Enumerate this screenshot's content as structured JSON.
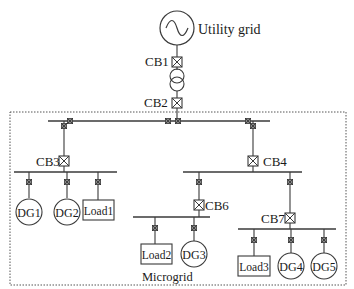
{
  "diagram": {
    "type": "single-line electrical diagram",
    "source": {
      "label": "Utility grid"
    },
    "breakers": {
      "cb1": "CB1",
      "cb2": "CB2",
      "cb3": "CB3",
      "cb4": "CB4",
      "cb6": "CB6",
      "cb7": "CB7"
    },
    "generators": {
      "dg1": "DG1",
      "dg2": "DG2",
      "dg3": "DG3",
      "dg4": "DG4",
      "dg5": "DG5"
    },
    "loads": {
      "load1": "Load1",
      "load2": "Load2",
      "load3": "Load3"
    },
    "boundary_label": "Microgrid"
  }
}
